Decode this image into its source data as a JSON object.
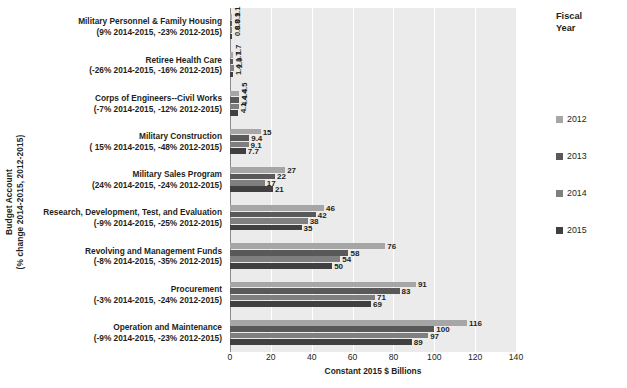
{
  "chart_data": {
    "type": "bar",
    "orientation": "horizontal",
    "title": "",
    "xlabel": "Constant 2015 $ Billions",
    "ylabel": "Budget Account (% change 2014-2015, 2012-2015)",
    "ylabel_lines": [
      "Budget Account",
      "(% change 2014-2015, 2012-2015)"
    ],
    "xlim": [
      0,
      140
    ],
    "xticks": [
      0,
      20,
      40,
      60,
      80,
      100,
      120,
      140
    ],
    "grid": true,
    "legend_title_lines": [
      "Fiscal",
      "Year"
    ],
    "legend_position": "right",
    "series": [
      {
        "name": "2012",
        "color": "#a6a6a6",
        "values": [
          116,
          91,
          76,
          46,
          27,
          15,
          4.5,
          1.7,
          1.1
        ]
      },
      {
        "name": "2013",
        "color": "#595959",
        "values": [
          100,
          83,
          58,
          42,
          22,
          9.4,
          4.4,
          1.7,
          0.9
        ]
      },
      {
        "name": "2014",
        "color": "#7f7f7f",
        "values": [
          97,
          71,
          54,
          38,
          17,
          9.1,
          4.4,
          2.0,
          0.8
        ]
      },
      {
        "name": "2015",
        "color": "#404040",
        "values": [
          89,
          69,
          50,
          35,
          21,
          7.7,
          4.1,
          1.4,
          0.8
        ]
      }
    ],
    "value_labels": {
      "2012": [
        "116",
        "91",
        "76",
        "46",
        "27",
        "15",
        "4.5",
        "1.7",
        "1.1"
      ],
      "2013": [
        "100",
        "83",
        "58",
        "42",
        "22",
        "9.4",
        "4.4",
        "1.7",
        "0.9"
      ],
      "2014": [
        "97",
        "71",
        "54",
        "38",
        "17",
        "9.1",
        "4.4",
        "2.0",
        "0.8"
      ],
      "2015": [
        "89",
        "69",
        "50",
        "35",
        "21",
        "7.7",
        "4.1",
        "1.4",
        "0.8"
      ]
    },
    "categories": [
      {
        "name": "Operation and Maintenance",
        "change": "(-9% 2014-2015, -23% 2012-2015)"
      },
      {
        "name": "Procurement",
        "change": "(-3% 2014-2015, -24% 2012-2015)"
      },
      {
        "name": "Revolving and Management Funds",
        "change": "(-8% 2014-2015, -35% 2012-2015)"
      },
      {
        "name": "Research, Development, Test, and Evaluation",
        "change": "(-9% 2014-2015, -25% 2012-2015)"
      },
      {
        "name": "Military Sales Program",
        "change": "(24% 2014-2015, -24% 2012-2015)"
      },
      {
        "name": "Military Construction",
        "change": "( 15% 2014-2015,  -48% 2012-2015)"
      },
      {
        "name": "Corps of Engineers--Civil Works",
        "change": "(-7% 2014-2015, -12% 2012-2015)"
      },
      {
        "name": "Retiree Health Care",
        "change": "(-26% 2014-2015, -16% 2012-2015)"
      },
      {
        "name": "Military Personnel & Family Housing",
        "change": "(9% 2014-2015, -23% 2012-2015)"
      }
    ],
    "categories_top_to_bottom": [
      "Military Personnel & Family Housing",
      "Retiree Health Care",
      "Corps of Engineers--Civil Works",
      "Military Construction",
      "Military Sales Program",
      "Research, Development, Test, and Evaluation",
      "Revolving and Management Funds",
      "Procurement",
      "Operation and Maintenance"
    ]
  }
}
